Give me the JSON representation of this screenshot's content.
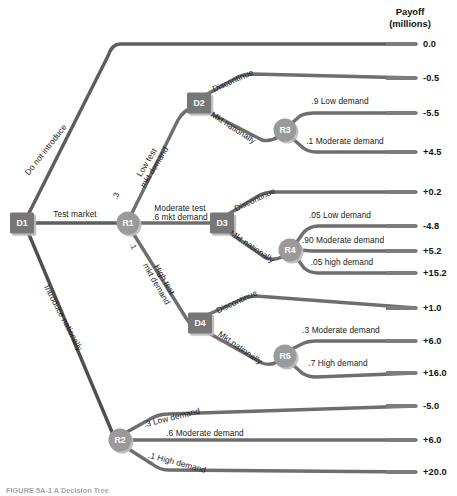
{
  "header": {
    "line1": "Payoff",
    "line2": "(millions)"
  },
  "caption": "FIGURE 5A-1  A Decision Tree",
  "colors": {
    "branch": "#6e6e6e",
    "branch_dark": "#4a4a4a",
    "decision_node": "#777777",
    "chance_node": "#9a9a9a",
    "node_text": "#ffffff",
    "text": "#1a1a1a",
    "background": "#ffffff"
  },
  "nodes": [
    {
      "id": "D1",
      "label": "D1",
      "type": "decision",
      "x": 22,
      "y": 223
    },
    {
      "id": "R1",
      "label": "R1",
      "type": "chance",
      "x": 128,
      "y": 223
    },
    {
      "id": "D2",
      "label": "D2",
      "type": "decision",
      "x": 199,
      "y": 103
    },
    {
      "id": "R3",
      "label": "R3",
      "type": "chance",
      "x": 285,
      "y": 130
    },
    {
      "id": "D3",
      "label": "D3",
      "type": "decision",
      "x": 222,
      "y": 223
    },
    {
      "id": "R4",
      "label": "R4",
      "type": "chance",
      "x": 290,
      "y": 250
    },
    {
      "id": "D4",
      "label": "D4",
      "type": "decision",
      "x": 200,
      "y": 323
    },
    {
      "id": "R5",
      "label": "R5",
      "type": "chance",
      "x": 285,
      "y": 356
    },
    {
      "id": "R2",
      "label": "R2",
      "type": "chance",
      "x": 120,
      "y": 440
    }
  ],
  "branch_labels": [
    {
      "name": "do-not-introduce",
      "text": "Do not introduce",
      "x": 46,
      "y": 150,
      "rotate": -52,
      "align": "center"
    },
    {
      "name": "test-market",
      "text": "Test market",
      "x": 75,
      "y": 215,
      "rotate": 0,
      "align": "center"
    },
    {
      "name": "introduce-nationally",
      "text": "Introduce nationally",
      "x": 63,
      "y": 318,
      "rotate": 62,
      "align": "center"
    },
    {
      "name": "low-test-mkt-demand",
      "text": "Low test\nmkt demand",
      "x": 151,
      "y": 165,
      "rotate": -59,
      "align": "center"
    },
    {
      "name": "moderate-test-demand",
      "text": "Moderate test\n.6 mkt demand",
      "x": 180,
      "y": 213,
      "rotate": 0,
      "align": "center"
    },
    {
      "name": "high-test-mkt-demand",
      "text": "High test\nmkt demand",
      "x": 160,
      "y": 282,
      "rotate": 60,
      "align": "center"
    },
    {
      "name": "d2-discontinue",
      "text": "Discontinue",
      "x": 233,
      "y": 81,
      "rotate": -24,
      "align": "center"
    },
    {
      "name": "d2-mkt-nationally",
      "text": "Mkt nationally",
      "x": 233,
      "y": 128,
      "rotate": 33,
      "align": "center"
    },
    {
      "name": "d3-discontinue",
      "text": "Discontinue",
      "x": 255,
      "y": 200,
      "rotate": -25,
      "align": "center"
    },
    {
      "name": "d3-mkt-nationally",
      "text": "Mkt nationally",
      "x": 252,
      "y": 247,
      "rotate": 34,
      "align": "center"
    },
    {
      "name": "d4-discontinue",
      "text": "Discontinue",
      "x": 237,
      "y": 302,
      "rotate": -25,
      "align": "center"
    },
    {
      "name": "d4-mkt-nationally",
      "text": "Mkt nationally",
      "x": 240,
      "y": 348,
      "rotate": 35,
      "align": "center"
    },
    {
      "name": "r3-low-demand",
      "text": ".9 Low demand",
      "x": 340,
      "y": 102,
      "rotate": 0,
      "align": "center"
    },
    {
      "name": "r3-moderate-demand",
      "text": ".1 Moderate demand",
      "x": 345,
      "y": 142,
      "rotate": 0,
      "align": "center"
    },
    {
      "name": "r4-low-demand",
      "text": ".05 Low demand",
      "x": 340,
      "y": 216,
      "rotate": 0,
      "align": "center"
    },
    {
      "name": "r4-moderate-demand",
      "text": ".90 Moderate demand",
      "x": 343,
      "y": 241,
      "rotate": 0,
      "align": "center"
    },
    {
      "name": "r4-high-demand",
      "text": ".05 high demand",
      "x": 342,
      "y": 263,
      "rotate": 0,
      "align": "center"
    },
    {
      "name": "r5-moderate-demand",
      "text": ".3 Moderate demand",
      "x": 341,
      "y": 331,
      "rotate": 0,
      "align": "center"
    },
    {
      "name": "r5-high-demand",
      "text": ".7 High demand",
      "x": 338,
      "y": 364,
      "rotate": 0,
      "align": "center"
    },
    {
      "name": "r2-low-demand",
      "text": ".3 Low demand",
      "x": 172,
      "y": 418,
      "rotate": -14,
      "align": "center"
    },
    {
      "name": "r2-moderate-demand",
      "text": ".6 Moderate demand",
      "x": 205,
      "y": 434,
      "rotate": 0,
      "align": "center"
    },
    {
      "name": "r2-high-demand",
      "text": ".1 High demand",
      "x": 177,
      "y": 463,
      "rotate": 15,
      "align": "center"
    }
  ],
  "probabilities": [
    {
      "name": "p-low-test",
      "text": ".3",
      "x": 116,
      "y": 196,
      "rotate": -66
    },
    {
      "name": "p-high-test",
      "text": ".1",
      "x": 133,
      "y": 246,
      "rotate": 62
    }
  ],
  "payoffs": [
    {
      "name": "payoff-do-not-introduce",
      "value": "0.0",
      "y": 44,
      "path": "Do not introduce"
    },
    {
      "name": "payoff-d2-discontinue",
      "value": "-0.5",
      "y": 78,
      "path": "Low test demand / Discontinue"
    },
    {
      "name": "payoff-r3-low",
      "value": "-5.5",
      "y": 113,
      "path": "Low test demand / Mkt nationally / .9 Low demand"
    },
    {
      "name": "payoff-r3-moderate",
      "value": "+4.5",
      "y": 152,
      "path": "Low test demand / Mkt nationally / .1 Moderate demand"
    },
    {
      "name": "payoff-d3-discontinue",
      "value": "+0.2",
      "y": 192,
      "path": "Moderate test demand / Discontinue"
    },
    {
      "name": "payoff-r4-low",
      "value": "-4.8",
      "y": 226,
      "path": "Moderate test demand / Mkt nationally / .05 Low demand"
    },
    {
      "name": "payoff-r4-moderate",
      "value": "+5.2",
      "y": 251,
      "path": "Moderate test demand / Mkt nationally / .90 Moderate demand"
    },
    {
      "name": "payoff-r4-high",
      "value": "+15.2",
      "y": 273,
      "path": "Moderate test demand / Mkt nationally / .05 high demand"
    },
    {
      "name": "payoff-d4-discontinue",
      "value": "+1.0",
      "y": 308,
      "path": "High test demand / Discontinue"
    },
    {
      "name": "payoff-r5-moderate",
      "value": "+6.0",
      "y": 341,
      "path": "High test demand / Mkt nationally / .3 Moderate demand"
    },
    {
      "name": "payoff-r5-high",
      "value": "+16.0",
      "y": 373,
      "path": "High test demand / Mkt nationally / .7 High demand"
    },
    {
      "name": "payoff-r2-low",
      "value": "-5.0",
      "y": 406,
      "path": "Introduce nationally / .3 Low demand"
    },
    {
      "name": "payoff-r2-moderate",
      "value": "+6.0",
      "y": 440,
      "path": "Introduce nationally / .6 Moderate demand"
    },
    {
      "name": "payoff-r2-high",
      "value": "+20.0",
      "y": 472,
      "path": "Introduce nationally / .1 High demand"
    }
  ],
  "chart_data": {
    "type": "diagram",
    "title": "A Decision Tree",
    "subtitle": "Payoff (millions)",
    "root": "D1",
    "structure": [
      {
        "from": "D1",
        "to": "terminal",
        "label": "Do not introduce",
        "prob": null,
        "payoff": 0.0
      },
      {
        "from": "D1",
        "to": "R1",
        "label": "Test market",
        "prob": null
      },
      {
        "from": "D1",
        "to": "R2",
        "label": "Introduce nationally",
        "prob": null
      },
      {
        "from": "R1",
        "to": "D2",
        "label": "Low test mkt demand",
        "prob": 0.3
      },
      {
        "from": "R1",
        "to": "D3",
        "label": "Moderate test mkt demand",
        "prob": 0.6
      },
      {
        "from": "R1",
        "to": "D4",
        "label": "High test mkt demand",
        "prob": 0.1
      },
      {
        "from": "D2",
        "to": "terminal",
        "label": "Discontinue",
        "payoff": -0.5
      },
      {
        "from": "D2",
        "to": "R3",
        "label": "Mkt nationally"
      },
      {
        "from": "R3",
        "to": "terminal",
        "label": "Low demand",
        "prob": 0.9,
        "payoff": -5.5
      },
      {
        "from": "R3",
        "to": "terminal",
        "label": "Moderate demand",
        "prob": 0.1,
        "payoff": 4.5
      },
      {
        "from": "D3",
        "to": "terminal",
        "label": "Discontinue",
        "payoff": 0.2
      },
      {
        "from": "D3",
        "to": "R4",
        "label": "Mkt nationally"
      },
      {
        "from": "R4",
        "to": "terminal",
        "label": "Low demand",
        "prob": 0.05,
        "payoff": -4.8
      },
      {
        "from": "R4",
        "to": "terminal",
        "label": "Moderate demand",
        "prob": 0.9,
        "payoff": 5.2
      },
      {
        "from": "R4",
        "to": "terminal",
        "label": "high demand",
        "prob": 0.05,
        "payoff": 15.2
      },
      {
        "from": "D4",
        "to": "terminal",
        "label": "Discontinue",
        "payoff": 1.0
      },
      {
        "from": "D4",
        "to": "R5",
        "label": "Mkt nationally"
      },
      {
        "from": "R5",
        "to": "terminal",
        "label": "Moderate demand",
        "prob": 0.3,
        "payoff": 6.0
      },
      {
        "from": "R5",
        "to": "terminal",
        "label": "High demand",
        "prob": 0.7,
        "payoff": 16.0
      },
      {
        "from": "R2",
        "to": "terminal",
        "label": "Low demand",
        "prob": 0.3,
        "payoff": -5.0
      },
      {
        "from": "R2",
        "to": "terminal",
        "label": "Moderate demand",
        "prob": 0.6,
        "payoff": 6.0
      },
      {
        "from": "R2",
        "to": "terminal",
        "label": "High demand",
        "prob": 0.1,
        "payoff": 20.0
      }
    ]
  }
}
